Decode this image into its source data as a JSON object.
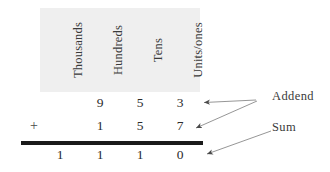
{
  "figure": {
    "title": "",
    "place_value_columns": [
      {
        "key": "thousands",
        "label": "Thousands"
      },
      {
        "key": "hundreds",
        "label": "Hundreds"
      },
      {
        "key": "tens",
        "label": "Tens"
      },
      {
        "key": "units",
        "label": "Units/ones"
      }
    ],
    "rows": [
      {
        "role": "addend",
        "operator": "",
        "digits": {
          "thousands": "",
          "hundreds": "9",
          "tens": "5",
          "units": "3"
        }
      },
      {
        "role": "addend",
        "operator": "+",
        "digits": {
          "thousands": "",
          "hundreds": "1",
          "tens": "5",
          "units": "7"
        }
      },
      {
        "role": "sum",
        "operator": "",
        "digits": {
          "thousands": "1",
          "hundreds": "1",
          "tens": "1",
          "units": "0"
        }
      }
    ],
    "annotations": [
      {
        "key": "addend",
        "label": "Addend",
        "arrow_targets": 2
      },
      {
        "key": "sum",
        "label": "Sum",
        "arrow_targets": 1
      }
    ],
    "colors": {
      "header_band": "#efefef",
      "rule": "#1a1a1a",
      "text": "#2b2b2b",
      "arrow": "#4a4a4a",
      "background": "#ffffff"
    }
  }
}
